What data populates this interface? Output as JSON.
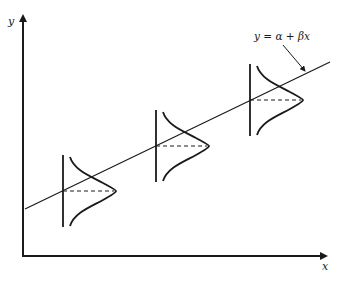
{
  "diagram": {
    "axes": {
      "x_label": "x",
      "y_label": "y"
    },
    "regression_line": {
      "equation": "y = α + βx"
    },
    "distributions": [
      {
        "name": "error-distribution-1",
        "position": "low x"
      },
      {
        "name": "error-distribution-2",
        "position": "middle x"
      },
      {
        "name": "error-distribution-3",
        "position": "high x"
      }
    ],
    "colors": {
      "ink": "#1a1a1a",
      "background": "#ffffff"
    }
  }
}
